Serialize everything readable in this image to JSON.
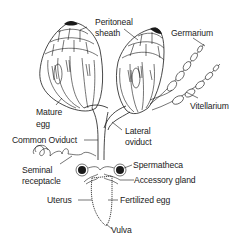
{
  "figure": {
    "colors": {
      "ink": "#1a1a1a",
      "background": "#ffffff",
      "label": "#222222"
    }
  },
  "labels": {
    "peritoneal_sheath_1": "Peritoneal",
    "peritoneal_sheath_2": "sheath",
    "germarium": "Germarium",
    "vitellarium": "Vitellarium",
    "mature_egg_1": "Mature",
    "mature_egg_2": "egg",
    "lateral_oviduct_1": "Lateral",
    "lateral_oviduct_2": "oviduct",
    "common_oviduct": "Common Oviduct",
    "seminal_receptacle_1": "Seminal",
    "seminal_receptacle_2": "receptacle",
    "spermatheca": "Spermatheca",
    "accessory_gland": "Accessory gland",
    "uterus": "Uterus",
    "fertilized_egg": "Fertilized egg",
    "vulva": "Vulva"
  }
}
